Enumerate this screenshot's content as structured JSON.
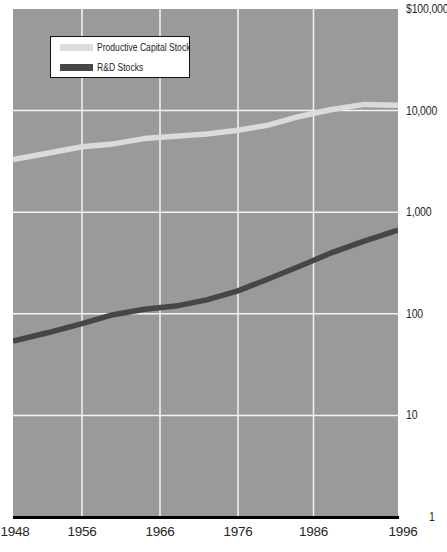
{
  "chart_data": {
    "type": "line",
    "title": "",
    "xlabel": "",
    "ylabel": "",
    "y_scale": "log",
    "ylim": [
      1,
      100000
    ],
    "xlim": [
      1948,
      1996
    ],
    "grid": true,
    "legend_position": "top-left",
    "x": [
      1948,
      1952,
      1956,
      1960,
      1964,
      1968,
      1972,
      1976,
      1980,
      1984,
      1988,
      1992,
      1996
    ],
    "series": [
      {
        "name": "Productive Capital Stock",
        "color": "#dbdbdb",
        "values": [
          3300,
          3800,
          4400,
          4700,
          5300,
          5600,
          5900,
          6400,
          7200,
          8700,
          10200,
          11500,
          11300
        ]
      },
      {
        "name": "R&D Stocks",
        "color": "#464646",
        "values": [
          54,
          65,
          80,
          98,
          111,
          119,
          137,
          168,
          220,
          290,
          395,
          520,
          665
        ]
      }
    ],
    "x_ticks": [
      "1948",
      "1956",
      "1966",
      "1976",
      "1986",
      "1996"
    ],
    "y_ticks": [
      {
        "label": "$100,000",
        "value": 100000,
        "gridline": false
      },
      {
        "label": "10,000",
        "value": 10000,
        "gridline": true
      },
      {
        "label": "1,000",
        "value": 1000,
        "gridline": true
      },
      {
        "label": "100",
        "value": 100,
        "gridline": true
      },
      {
        "label": "10",
        "value": 10,
        "gridline": true
      },
      {
        "label": "1",
        "value": 1,
        "gridline": false
      }
    ],
    "colors": {
      "plot_bg": "#9a9a9a",
      "grid": "#f4f4f4",
      "axis_line": "#000000",
      "tick_text": "#262626"
    }
  }
}
